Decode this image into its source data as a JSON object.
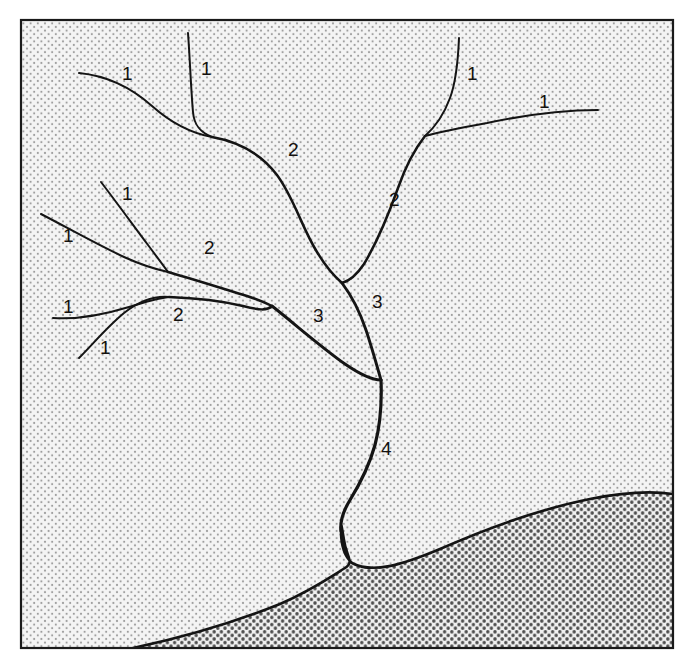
{
  "figure": {
    "canvas": {
      "width": 691,
      "height": 662
    },
    "frame": {
      "left": 21,
      "top": 20,
      "right": 673,
      "bottom": 648,
      "stroke": "#1a1a1a",
      "stroke_width": 2.2
    }
  },
  "colors": {
    "page_background": "#ffffff",
    "land_fill": "#f2f2f2",
    "sea_fill": "#ececec",
    "land_stipple": "#9a9a9a",
    "sea_stipple": "#4d4d4d",
    "stream_stroke": "#141414",
    "coast_stroke": "#141414",
    "frame_stroke": "#1a1a1a",
    "label_color": "#14110f"
  },
  "legend_semantics": {
    "order_1": "first-order (unbranched fingertip) stream",
    "order_2": "second-order stream formed where two first-order streams join",
    "order_3": "third-order stream formed where two second-order streams join",
    "order_4": "fourth-order trunk stream formed where two third-order streams join, entering the sea"
  },
  "order_labels": [
    {
      "id": "label-1-a",
      "text": "1",
      "x": 122,
      "y": 80,
      "order": 1
    },
    {
      "id": "label-1-b",
      "text": "1",
      "x": 201,
      "y": 75,
      "order": 1
    },
    {
      "id": "label-1-c",
      "text": "1",
      "x": 467,
      "y": 80,
      "order": 1
    },
    {
      "id": "label-1-d",
      "text": "1",
      "x": 539,
      "y": 108,
      "order": 1
    },
    {
      "id": "label-1-e",
      "text": "1",
      "x": 122,
      "y": 200,
      "order": 1
    },
    {
      "id": "label-1-f",
      "text": "1",
      "x": 63,
      "y": 242,
      "order": 1
    },
    {
      "id": "label-1-g",
      "text": "1",
      "x": 63,
      "y": 313,
      "order": 1
    },
    {
      "id": "label-1-h",
      "text": "1",
      "x": 100,
      "y": 354,
      "order": 1
    },
    {
      "id": "label-2-a",
      "text": "2",
      "x": 288,
      "y": 156,
      "order": 2
    },
    {
      "id": "label-2-b",
      "text": "2",
      "x": 389,
      "y": 206,
      "order": 2
    },
    {
      "id": "label-2-c",
      "text": "2",
      "x": 204,
      "y": 254,
      "order": 2
    },
    {
      "id": "label-2-d",
      "text": "2",
      "x": 173,
      "y": 321,
      "order": 2
    },
    {
      "id": "label-3-a",
      "text": "3",
      "x": 313,
      "y": 322,
      "order": 3
    },
    {
      "id": "label-3-b",
      "text": "3",
      "x": 372,
      "y": 308,
      "order": 3
    },
    {
      "id": "label-4-a",
      "text": "4",
      "x": 381,
      "y": 455,
      "order": 4
    }
  ],
  "streams": [
    {
      "id": "stream-1-a",
      "order": 1,
      "label_ref": "label-1-a",
      "path": "M 79,73 C 110,76 134,90 152,106 C 170,122 190,133 212,137"
    },
    {
      "id": "stream-1-b",
      "order": 1,
      "label_ref": "label-1-b",
      "path": "M 188,33 C 190,60 191,90 193,112 C 194,124 199,132 212,137"
    },
    {
      "id": "stream-2-a",
      "order": 2,
      "label_ref": "label-2-a",
      "path": "M 212,137 C 240,142 262,155 277,175 C 294,198 302,228 317,252 C 326,267 334,276 342,283"
    },
    {
      "id": "stream-1-c",
      "order": 1,
      "label_ref": "label-1-c",
      "path": "M 459,38 C 458,62 456,82 450,98 C 443,117 434,128 425,136"
    },
    {
      "id": "stream-1-d",
      "order": 1,
      "label_ref": "label-1-d",
      "path": "M 598,110 C 560,110 520,116 487,123 C 460,128 440,132 425,136"
    },
    {
      "id": "stream-2-b",
      "order": 2,
      "label_ref": "label-2-b",
      "path": "M 425,136 C 414,150 405,168 398,188 C 388,216 376,244 364,264 C 356,276 349,281 342,283"
    },
    {
      "id": "stream-3-b",
      "order": 3,
      "label_ref": "label-3-b",
      "path": "M 342,283 C 351,295 360,312 366,330 C 372,348 377,366 381,380"
    },
    {
      "id": "stream-1-e",
      "order": 1,
      "label_ref": "label-1-e",
      "path": "M 101,182 C 117,203 133,225 148,245 C 157,257 163,265 168,272"
    },
    {
      "id": "stream-1-f",
      "order": 1,
      "label_ref": "label-1-f",
      "path": "M 41,214 C 68,228 98,245 124,257 C 146,267 159,270 168,272"
    },
    {
      "id": "stream-2-c",
      "order": 2,
      "label_ref": "label-2-c",
      "path": "M 168,272 C 196,280 224,289 247,296 C 259,300 266,303 272,306"
    },
    {
      "id": "stream-1-g",
      "order": 1,
      "label_ref": "label-1-g",
      "path": "M 53,318 C 80,320 106,314 129,307 C 148,301 160,298 169,297"
    },
    {
      "id": "stream-1-h",
      "order": 1,
      "label_ref": "label-1-h",
      "path": "M 79,358 C 93,344 107,327 124,313 C 142,299 157,296 169,297"
    },
    {
      "id": "stream-2-d",
      "order": 2,
      "label_ref": "label-2-d",
      "path": "M 169,297 C 196,298 222,301 243,306 C 259,310 267,311 272,306"
    },
    {
      "id": "stream-3-a",
      "order": 3,
      "label_ref": "label-3-a",
      "path": "M 272,306 C 296,325 321,347 345,364 C 361,375 373,380 381,380"
    },
    {
      "id": "stream-4-a",
      "order": 4,
      "label_ref": "label-4-a",
      "path": "M 381,380 C 382,404 380,426 375,445 C 368,470 358,487 350,500 C 342,513 340,522 341,531"
    }
  ],
  "coastline": {
    "id": "coastline",
    "note": "shoreline separating stippled land (upper) from more densely stippled sea (lower right); includes the narrow estuary of the fourth-order trunk stream",
    "path": "M 133,648 C 190,636 240,620 280,604 C 312,590 332,576 345,568 C 355,562 346,556 344,540 C 342,528 341,520 341,531 C 341,545 344,556 352,563 C 372,574 402,565 440,549 C 490,527 545,508 590,499 C 625,492 652,491 673,494"
  },
  "stipple": {
    "land": {
      "spacing": 7.2,
      "dot_radius": 1.05,
      "color": "#9a9a9a"
    },
    "sea": {
      "spacing": 7.2,
      "dot_radius": 1.65,
      "color": "#4d4d4d"
    }
  }
}
